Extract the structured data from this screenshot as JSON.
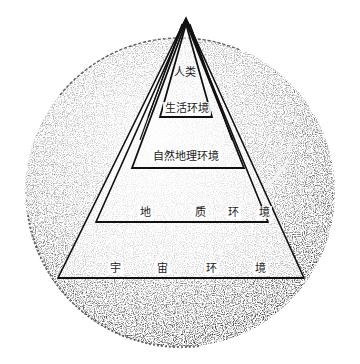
{
  "diagram": {
    "title_cropped": "",
    "layers": [
      {
        "id": "human",
        "label": "人类"
      },
      {
        "id": "living",
        "label": "生活环境"
      },
      {
        "id": "natural_geo",
        "label": "自然地理环境"
      },
      {
        "id": "geologic",
        "label": "地质环境",
        "chars": [
          "地",
          "质",
          "环",
          "境"
        ]
      },
      {
        "id": "cosmic",
        "label": "宇宙环境",
        "chars": [
          "宇",
          "宙",
          "环",
          "境"
        ]
      }
    ],
    "colors": {
      "ink": "#1a1a1a",
      "speckle_dark": "#2a2a2a",
      "paper": "#ffffff"
    }
  }
}
